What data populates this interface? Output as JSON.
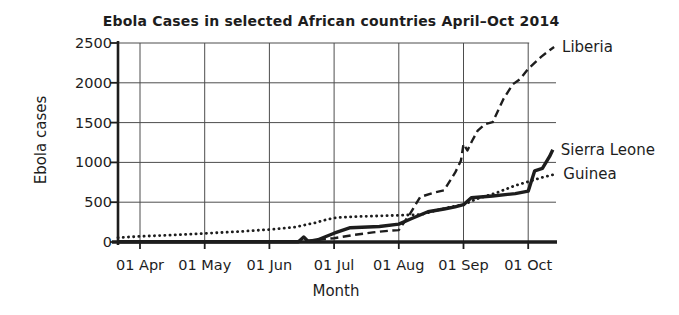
{
  "figure": {
    "title": "Ebola Cases in selected African countries April–Oct 2014",
    "ylabel": "Ebola cases",
    "xlabel": "Month"
  },
  "colors": {
    "ink": "#1d1d1d",
    "grid": "#4d4d4d",
    "background": "#ffffff"
  },
  "chart_data": {
    "type": "line",
    "title": "Ebola Cases in selected African countries April–Oct 2014",
    "xlabel": "Month",
    "ylabel": "Ebola cases",
    "x_unit": "months after 01 Apr 2014 (0 = 01 Apr, 6 = 01 Oct)",
    "x_ticks": [
      "01 Apr",
      "01 May",
      "01 Jun",
      "01 Jul",
      "01 Aug",
      "01 Sep",
      "01 Oct"
    ],
    "x_tick_positions": [
      0,
      1,
      2,
      3,
      4,
      5,
      6
    ],
    "y_ticks": [
      0,
      500,
      1000,
      1500,
      2000,
      2500
    ],
    "ylim": [
      0,
      2500
    ],
    "xlim": [
      -0.34,
      6.45
    ],
    "grid": true,
    "legend_position": "labels-at-line-ends-right",
    "series": [
      {
        "name": "Liberia",
        "line_style": "dashed",
        "color": "#1d1d1d",
        "points": [
          [
            -0.34,
            2
          ],
          [
            2.25,
            2
          ],
          [
            2.6,
            18
          ],
          [
            3.0,
            48
          ],
          [
            3.3,
            88
          ],
          [
            3.6,
            120
          ],
          [
            3.85,
            142
          ],
          [
            4.0,
            150
          ],
          [
            4.17,
            350
          ],
          [
            4.33,
            565
          ],
          [
            4.55,
            622
          ],
          [
            4.7,
            650
          ],
          [
            4.87,
            870
          ],
          [
            4.96,
            1020
          ],
          [
            5.0,
            1230
          ],
          [
            5.06,
            1150
          ],
          [
            5.13,
            1265
          ],
          [
            5.22,
            1400
          ],
          [
            5.33,
            1480
          ],
          [
            5.45,
            1505
          ],
          [
            5.62,
            1800
          ],
          [
            5.76,
            1980
          ],
          [
            5.88,
            2050
          ],
          [
            6.0,
            2175
          ],
          [
            6.2,
            2325
          ],
          [
            6.33,
            2410
          ],
          [
            6.4,
            2450
          ]
        ]
      },
      {
        "name": "Sierra Leone",
        "line_style": "solid",
        "color": "#1d1d1d",
        "points": [
          [
            -0.34,
            2
          ],
          [
            2.45,
            2
          ],
          [
            2.53,
            62
          ],
          [
            2.6,
            8
          ],
          [
            2.75,
            28
          ],
          [
            3.0,
            110
          ],
          [
            3.25,
            180
          ],
          [
            3.7,
            195
          ],
          [
            4.0,
            225
          ],
          [
            4.2,
            295
          ],
          [
            4.45,
            380
          ],
          [
            4.7,
            415
          ],
          [
            4.87,
            442
          ],
          [
            5.0,
            468
          ],
          [
            5.12,
            555
          ],
          [
            5.45,
            578
          ],
          [
            5.8,
            608
          ],
          [
            6.0,
            638
          ],
          [
            6.1,
            895
          ],
          [
            6.22,
            925
          ],
          [
            6.33,
            1075
          ],
          [
            6.38,
            1160
          ]
        ]
      },
      {
        "name": "Guinea",
        "line_style": "dotted",
        "color": "#1d1d1d",
        "points": [
          [
            -0.34,
            55
          ],
          [
            0,
            70
          ],
          [
            0.5,
            88
          ],
          [
            1.0,
            108
          ],
          [
            1.5,
            130
          ],
          [
            2.0,
            157
          ],
          [
            2.4,
            188
          ],
          [
            2.7,
            240
          ],
          [
            2.9,
            285
          ],
          [
            3.05,
            308
          ],
          [
            3.3,
            318
          ],
          [
            3.6,
            325
          ],
          [
            4.0,
            335
          ],
          [
            4.35,
            345
          ],
          [
            4.6,
            402
          ],
          [
            4.85,
            448
          ],
          [
            5.0,
            470
          ],
          [
            5.2,
            540
          ],
          [
            5.5,
            615
          ],
          [
            5.8,
            710
          ],
          [
            6.0,
            758
          ],
          [
            6.2,
            808
          ],
          [
            6.42,
            852
          ]
        ]
      }
    ]
  }
}
